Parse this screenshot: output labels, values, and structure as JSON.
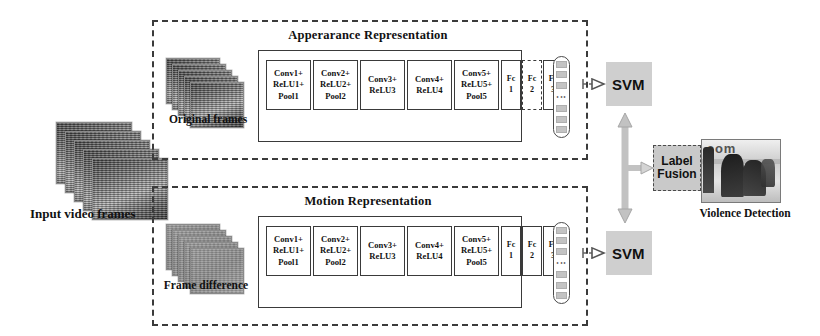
{
  "diagram": {
    "background_color": "#ffffff"
  },
  "input": {
    "label": "Input video frames",
    "frame_count": 5
  },
  "streams": [
    {
      "id": "appearance",
      "title": "Apperarance Representation",
      "input_label_line1": "Original",
      "input_label_line2": "frames",
      "frame_count": 5,
      "frame_style": "video",
      "blocks": [
        {
          "name": "conv1",
          "lines": [
            "Conv1+",
            "ReLU1+",
            "Pool1"
          ],
          "border": "solid"
        },
        {
          "name": "conv2",
          "lines": [
            "Conv2+",
            "ReLU2+",
            "Pool2"
          ],
          "border": "solid"
        },
        {
          "name": "conv3",
          "lines": [
            "Conv3+",
            "ReLU3"
          ],
          "border": "solid"
        },
        {
          "name": "conv4",
          "lines": [
            "Conv4+",
            "ReLU4"
          ],
          "border": "solid"
        },
        {
          "name": "conv5",
          "lines": [
            "Conv5+",
            "ReLU5+",
            "Pool5"
          ],
          "border": "solid"
        },
        {
          "name": "fc1",
          "lines": [
            "Fc",
            "1"
          ],
          "border": "solid"
        },
        {
          "name": "fc2",
          "lines": [
            "Fc",
            "2"
          ],
          "border": "dashed"
        },
        {
          "name": "fc3",
          "lines": [
            "Fc",
            "3"
          ],
          "border": "solid"
        }
      ],
      "feature_vector": {
        "name": "feature-vector",
        "ellipsis": "⋮"
      },
      "classifier": {
        "label": "SVM",
        "color": "#cfcfcf"
      }
    },
    {
      "id": "motion",
      "title": "Motion Representation",
      "input_label_line1": "Frame",
      "input_label_line2": "difference",
      "frame_count": 5,
      "frame_style": "difference",
      "blocks": [
        {
          "name": "conv1",
          "lines": [
            "Conv1+",
            "ReLU1+",
            "Pool1"
          ],
          "border": "solid"
        },
        {
          "name": "conv2",
          "lines": [
            "Conv2+",
            "ReLU2+",
            "Pool2"
          ],
          "border": "solid"
        },
        {
          "name": "conv3",
          "lines": [
            "Conv3+",
            "ReLU3"
          ],
          "border": "solid"
        },
        {
          "name": "conv4",
          "lines": [
            "Conv4+",
            "ReLU4"
          ],
          "border": "solid"
        },
        {
          "name": "conv5",
          "lines": [
            "Conv5+",
            "ReLU5+",
            "Pool5"
          ],
          "border": "solid"
        },
        {
          "name": "fc1",
          "lines": [
            "Fc",
            "1"
          ],
          "border": "solid"
        },
        {
          "name": "fc2",
          "lines": [
            "Fc",
            "2"
          ],
          "border": "solid"
        },
        {
          "name": "fc3",
          "lines": [
            "Fc",
            "3"
          ],
          "border": "solid"
        }
      ],
      "feature_vector": {
        "name": "feature-vector",
        "ellipsis": "⋮"
      },
      "classifier": {
        "label": "SVM",
        "color": "#cfcfcf"
      }
    }
  ],
  "fusion": {
    "line1": "Label",
    "line2": "Fusion",
    "color": "#c9c9c9"
  },
  "output": {
    "caption": "Violence Detection",
    "photo_overlay_text": "com"
  },
  "colors": {
    "stream_border": "#3b3b3b",
    "block_border": "#3a3a3a",
    "svm_fill": "#cfcfcf",
    "fusion_fill": "#c9c9c9",
    "arrow_gray": "#b0b0b0",
    "text": "#111111"
  }
}
